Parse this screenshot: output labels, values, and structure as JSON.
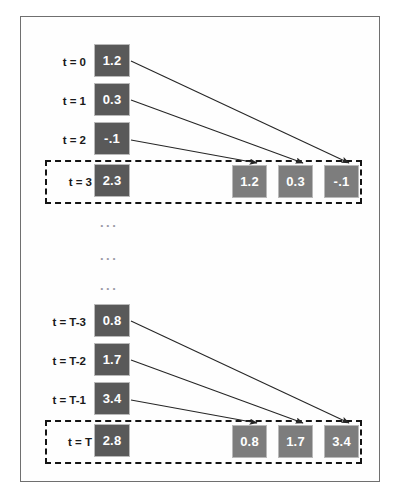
{
  "figure": {
    "background_color": "#ffffff",
    "frame_color": "#6f6f6f",
    "source_box_color": "#595959",
    "buffer_box_color": "#7d7d7d",
    "dashed_box_color": "#141414",
    "arrow_color": "#262626",
    "text_color": "#1a1a1a",
    "box_text_color": "#ffffff"
  },
  "ellipses": [
    {
      "text": "..."
    },
    {
      "text": "..."
    },
    {
      "text": "..."
    }
  ],
  "groups": [
    {
      "id": "top",
      "source_rows": [
        {
          "label": "t = 0",
          "value": "1.2"
        },
        {
          "label": "t = 1",
          "value": "0.3"
        },
        {
          "label": "t = 2",
          "value": "-.1"
        }
      ],
      "current_row": {
        "label": "t = 3",
        "value": "2.3",
        "buffer": [
          {
            "value": "1.2"
          },
          {
            "value": "0.3"
          },
          {
            "value": "-.1"
          }
        ]
      },
      "arrows": [
        {
          "from": "t = 0",
          "to_buffer_index": 2
        },
        {
          "from": "t = 1",
          "to_buffer_index": 1
        },
        {
          "from": "t = 2",
          "to_buffer_index": 0
        }
      ]
    },
    {
      "id": "bottom",
      "source_rows": [
        {
          "label": "t = T-3",
          "value": "0.8"
        },
        {
          "label": "t = T-2",
          "value": "1.7"
        },
        {
          "label": "t = T-1",
          "value": "3.4"
        }
      ],
      "current_row": {
        "label": "t = T",
        "value": "2.8",
        "buffer": [
          {
            "value": "0.8"
          },
          {
            "value": "1.7"
          },
          {
            "value": "3.4"
          }
        ]
      },
      "arrows": [
        {
          "from": "t = T-3",
          "to_buffer_index": 2
        },
        {
          "from": "t = T-2",
          "to_buffer_index": 1
        },
        {
          "from": "t = T-1",
          "to_buffer_index": 0
        }
      ]
    }
  ]
}
